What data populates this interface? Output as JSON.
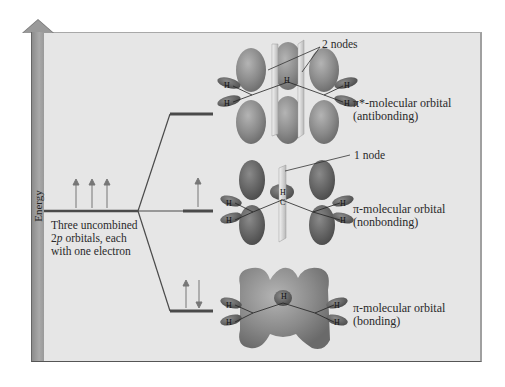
{
  "axis": {
    "label": "Energy"
  },
  "left_level": {
    "label_lines": [
      "Three uncombined",
      "2p orbitals, each",
      "with one electron"
    ],
    "electrons": 3
  },
  "orbitals": [
    {
      "id": "antibonding",
      "name": "π*-molecular orbital",
      "type": "(antibonding)",
      "electrons": [],
      "node_label": "2 nodes"
    },
    {
      "id": "nonbonding",
      "name": "π-molecular orbital",
      "type": "(nonbonding)",
      "electrons": [
        "up"
      ],
      "node_label": "1 node"
    },
    {
      "id": "bonding",
      "name": "π-molecular orbital",
      "type": "(bonding)",
      "electrons": [
        "up",
        "down"
      ],
      "node_label": ""
    }
  ],
  "atoms": {
    "hydrogen": "H",
    "carbon": "C"
  },
  "colors": {
    "panel_bg": "#e6e6e6",
    "energy_bar": "#9a9a9a",
    "level_line": "#4a4a4a",
    "lobe": "#8d8d8d",
    "lobe_dark": "#5e5e5e",
    "node_plane": "#d6d6d6"
  }
}
